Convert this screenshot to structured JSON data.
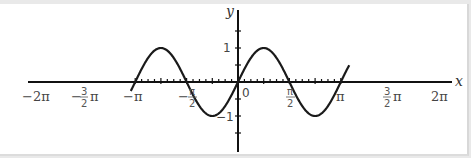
{
  "chart_data": {
    "type": "line",
    "title": "",
    "function": "y = sin(x)",
    "xlabel": "x",
    "ylabel": "y",
    "xlim": [
      -6.55,
      6.8
    ],
    "ylim": [
      -1.8,
      1.6
    ],
    "grid": false,
    "legend": null,
    "x_tick_labels": [
      "−2π",
      "−3/2 π",
      "−π",
      "−π/2",
      "0",
      "π/2",
      "π",
      "3/2 π",
      "2π"
    ],
    "x_ticks": [
      -6.2832,
      -4.7124,
      -3.1416,
      -1.5708,
      0,
      1.5708,
      3.1416,
      4.7124,
      6.2832
    ],
    "y_tick_labels": [
      "1",
      "−1"
    ],
    "y_ticks": [
      1,
      -1
    ],
    "series": [
      {
        "name": "sin(x)",
        "x": [
          -6.55,
          -6.2832,
          -5.4978,
          -4.7124,
          -3.927,
          -3.1416,
          -2.3562,
          -1.5708,
          -0.7854,
          0,
          0.7854,
          1.5708,
          2.3562,
          3.1416,
          3.927,
          4.7124,
          5.4978,
          6.2832,
          6.8
        ],
        "values": [
          -0.26,
          0,
          0.707,
          1,
          0.707,
          0,
          -0.707,
          -1,
          -0.707,
          0,
          0.707,
          1,
          0.707,
          0,
          -0.707,
          -1,
          -0.707,
          0,
          0.49
        ]
      }
    ]
  },
  "axes": {
    "x_label": "x",
    "y_label": "y",
    "origin_label": "0",
    "y_pos_label": "1",
    "y_neg_label": "−1",
    "labels": {
      "neg2pi": "−2π",
      "neg3half_minus": "−",
      "neg3half_num": "3",
      "neg3half_den": "2",
      "neg3half_pi": "π",
      "negpi": "−π",
      "neghalf_minus": "−",
      "neghalf_num": "π",
      "neghalf_den": "2",
      "half_num": "π",
      "half_den": "2",
      "pi": "π",
      "three_half_num": "3",
      "three_half_den": "2",
      "three_half_pi": "π",
      "two_pi": "2π"
    }
  }
}
